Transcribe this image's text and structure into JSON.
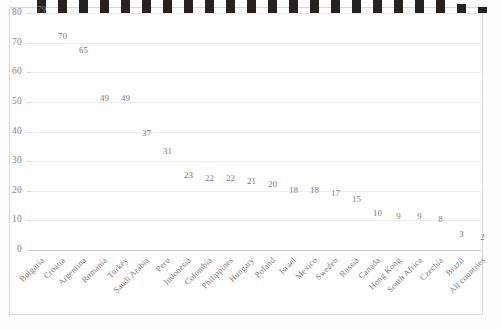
{
  "chart_data": {
    "type": "bar",
    "title": "",
    "xlabel": "",
    "ylabel": "",
    "ylim": [
      0,
      80
    ],
    "yticks": [
      0,
      10,
      20,
      30,
      40,
      50,
      60,
      70,
      80
    ],
    "grid": true,
    "legend": "none",
    "bar_color": "#262220",
    "categories": [
      "Bulgaria",
      "Croatia",
      "Argentina",
      "Romania",
      "Turkey",
      "Saudi Arabia",
      "Peru",
      "Indonesia",
      "Colombia",
      "Philippines",
      "Hungary",
      "Poland",
      "Israel",
      "Mexico",
      "Sweden",
      "Russia",
      "Canada",
      "Hong Kong",
      "South Africa",
      "Czechia",
      "Brazil",
      "All countries"
    ],
    "values": [
      79,
      70,
      65,
      49,
      49,
      37,
      31,
      23,
      22,
      22,
      21,
      20,
      18,
      18,
      17,
      15,
      10,
      9,
      9,
      8,
      3,
      2
    ]
  }
}
